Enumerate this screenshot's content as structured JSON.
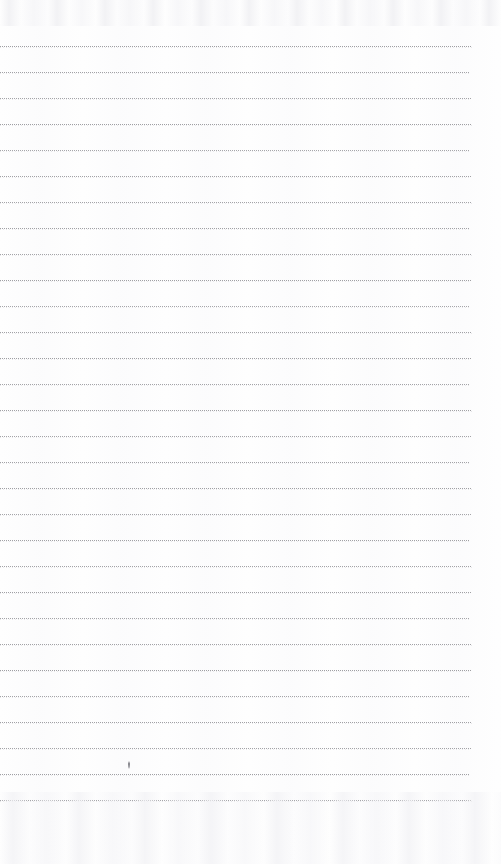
{
  "document": {
    "type": "scanned-ruled-notebook-page",
    "title": "",
    "page_text": "",
    "background_color": "#fefefe",
    "width": 501,
    "height": 864
  },
  "ruling": {
    "line_color": "#9b9b9f",
    "line_style": "dotted",
    "line_thickness_px": 1,
    "line_spacing_px": 26,
    "first_line_y": 46,
    "last_line_y": 800,
    "line_count": 30,
    "line_start_x": 0,
    "line_end_x": 472,
    "lines": [
      {
        "index": 1,
        "y": 46,
        "x_start": 0,
        "x_end": 472,
        "opacity": 0.95
      },
      {
        "index": 2,
        "y": 72,
        "x_start": 0,
        "x_end": 470,
        "opacity": 0.92
      },
      {
        "index": 3,
        "y": 98,
        "x_start": 0,
        "x_end": 471,
        "opacity": 0.9
      },
      {
        "index": 4,
        "y": 124,
        "x_start": 0,
        "x_end": 472,
        "opacity": 0.95
      },
      {
        "index": 5,
        "y": 150,
        "x_start": 0,
        "x_end": 470,
        "opacity": 0.88
      },
      {
        "index": 6,
        "y": 176,
        "x_start": 0,
        "x_end": 471,
        "opacity": 0.92
      },
      {
        "index": 7,
        "y": 202,
        "x_start": 0,
        "x_end": 472,
        "opacity": 0.9
      },
      {
        "index": 8,
        "y": 228,
        "x_start": 0,
        "x_end": 470,
        "opacity": 0.93
      },
      {
        "index": 9,
        "y": 254,
        "x_start": 0,
        "x_end": 472,
        "opacity": 0.9
      },
      {
        "index": 10,
        "y": 280,
        "x_start": 0,
        "x_end": 471,
        "opacity": 0.94
      },
      {
        "index": 11,
        "y": 306,
        "x_start": 0,
        "x_end": 470,
        "opacity": 0.88
      },
      {
        "index": 12,
        "y": 332,
        "x_start": 0,
        "x_end": 472,
        "opacity": 0.92
      },
      {
        "index": 13,
        "y": 358,
        "x_start": 0,
        "x_end": 471,
        "opacity": 0.95
      },
      {
        "index": 14,
        "y": 384,
        "x_start": 0,
        "x_end": 470,
        "opacity": 0.9
      },
      {
        "index": 15,
        "y": 410,
        "x_start": 0,
        "x_end": 472,
        "opacity": 0.93
      },
      {
        "index": 16,
        "y": 436,
        "x_start": 0,
        "x_end": 471,
        "opacity": 0.9
      },
      {
        "index": 17,
        "y": 462,
        "x_start": 0,
        "x_end": 470,
        "opacity": 0.92
      },
      {
        "index": 18,
        "y": 488,
        "x_start": 0,
        "x_end": 472,
        "opacity": 0.94
      },
      {
        "index": 19,
        "y": 514,
        "x_start": 0,
        "x_end": 471,
        "opacity": 0.89
      },
      {
        "index": 20,
        "y": 540,
        "x_start": 0,
        "x_end": 470,
        "opacity": 0.93
      },
      {
        "index": 21,
        "y": 566,
        "x_start": 0,
        "x_end": 472,
        "opacity": 0.91
      },
      {
        "index": 22,
        "y": 592,
        "x_start": 0,
        "x_end": 471,
        "opacity": 0.94
      },
      {
        "index": 23,
        "y": 618,
        "x_start": 0,
        "x_end": 470,
        "opacity": 0.9
      },
      {
        "index": 24,
        "y": 644,
        "x_start": 0,
        "x_end": 472,
        "opacity": 0.92
      },
      {
        "index": 25,
        "y": 670,
        "x_start": 0,
        "x_end": 471,
        "opacity": 0.95
      },
      {
        "index": 26,
        "y": 696,
        "x_start": 0,
        "x_end": 470,
        "opacity": 0.9
      },
      {
        "index": 27,
        "y": 722,
        "x_start": 0,
        "x_end": 472,
        "opacity": 0.93
      },
      {
        "index": 28,
        "y": 748,
        "x_start": 0,
        "x_end": 471,
        "opacity": 0.91
      },
      {
        "index": 29,
        "y": 774,
        "x_start": 0,
        "x_end": 470,
        "opacity": 0.94
      },
      {
        "index": 30,
        "y": 800,
        "x_start": 0,
        "x_end": 472,
        "opacity": 0.92
      }
    ]
  },
  "marks": [
    {
      "name": "pen-mark",
      "x": 128,
      "y": 761,
      "width": 2,
      "height": 8,
      "color": "#60606a"
    }
  ],
  "artifacts": {
    "top_noise_height": 26,
    "bottom_noise_height": 72,
    "noise_color": "#f2f2f5"
  }
}
